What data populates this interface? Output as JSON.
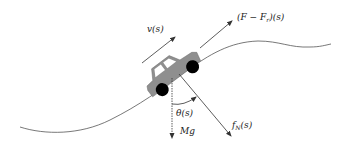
{
  "diagram": {
    "colors": {
      "line": "#333333",
      "road": "#555555",
      "car_body": "#8f8f8f",
      "wheel": "#000000",
      "window": "#ffffff"
    },
    "labels": {
      "velocity": "v(s)",
      "traction_main": "(F − F",
      "traction_sub": "r",
      "traction_tail": ")(s)",
      "angle": "θ(s)",
      "gravity": "Mg",
      "normal_main": "f",
      "normal_sub": "N",
      "normal_tail": "(s)"
    },
    "elements": [
      "road-curve",
      "car",
      "velocity-arrow",
      "traction-arrow",
      "gravity-arrow",
      "normal-force-arrow",
      "angle-arc"
    ]
  }
}
